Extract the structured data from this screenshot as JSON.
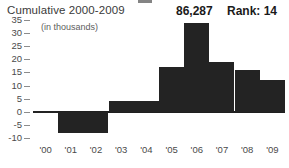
{
  "header": {
    "title": "Cumulative 2000-2009",
    "value": "86,287",
    "rank": "Rank: 14"
  },
  "chart_data": {
    "type": "bar",
    "title": "Cumulative 2000-2009",
    "units_label": "(in thousands)",
    "xlabel": "",
    "ylabel": "",
    "grid": false,
    "legend": "none",
    "ylim": [
      -10,
      35
    ],
    "yticks": [
      35,
      30,
      25,
      20,
      15,
      10,
      5,
      0,
      -5,
      -10
    ],
    "ytick_labels": [
      "35",
      "30",
      "25",
      "20",
      "15",
      "10",
      "5",
      "0",
      "-5",
      "-10"
    ],
    "categories": [
      "'00",
      "'01",
      "'02",
      "'03",
      "'04",
      "'05",
      "'06",
      "'07",
      "'08",
      "'09"
    ],
    "values": [
      0.4,
      -8,
      -8,
      4,
      4,
      17,
      34,
      19,
      16,
      12
    ],
    "bar_color": "#232323"
  }
}
